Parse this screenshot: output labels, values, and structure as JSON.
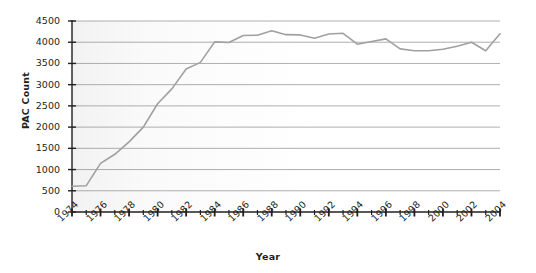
{
  "chart_data": {
    "type": "line",
    "title": "",
    "xlabel": "Year",
    "ylabel": "PAC Count",
    "xlim": [
      1974,
      2004
    ],
    "ylim": [
      0,
      4500
    ],
    "grid": true,
    "legend": false,
    "legend_position": "none",
    "series_color": "#a0a0a0",
    "y_ticks": [
      0,
      500,
      1000,
      1500,
      2000,
      2500,
      3000,
      3500,
      4000,
      4500
    ],
    "y_tick_labels": [
      "0",
      "500",
      "1000",
      "1500",
      "2000",
      "2500",
      "3000",
      "3500",
      "4000",
      "4500"
    ],
    "x_tick_labels": [
      "1974",
      "1976",
      "1978",
      "1980",
      "1982",
      "1984",
      "1986",
      "1988",
      "1990",
      "1992",
      "1994",
      "1996",
      "1998",
      "2000",
      "2002",
      "2004"
    ],
    "x": [
      1974,
      1975,
      1976,
      1977,
      1978,
      1979,
      1980,
      1981,
      1982,
      1983,
      1984,
      1985,
      1986,
      1987,
      1988,
      1989,
      1990,
      1991,
      1992,
      1993,
      1994,
      1995,
      1996,
      1997,
      1998,
      1999,
      2000,
      2001,
      2002,
      2003,
      2004
    ],
    "values": [
      608,
      620,
      1146,
      1360,
      1653,
      2000,
      2551,
      2901,
      3371,
      3525,
      4009,
      3992,
      4157,
      4165,
      4268,
      4178,
      4172,
      4094,
      4195,
      4210,
      3954,
      4016,
      4079,
      3844,
      3798,
      3798,
      3835,
      3907,
      4000,
      3800,
      4200
    ],
    "series": [
      {
        "name": "PAC Count",
        "values": [
          608,
          620,
          1146,
          1360,
          1653,
          2000,
          2551,
          2901,
          3371,
          3525,
          4009,
          3992,
          4157,
          4165,
          4268,
          4178,
          4172,
          4094,
          4195,
          4210,
          3954,
          4016,
          4079,
          3844,
          3798,
          3798,
          3835,
          3907,
          4000,
          3800,
          4200
        ]
      }
    ]
  }
}
